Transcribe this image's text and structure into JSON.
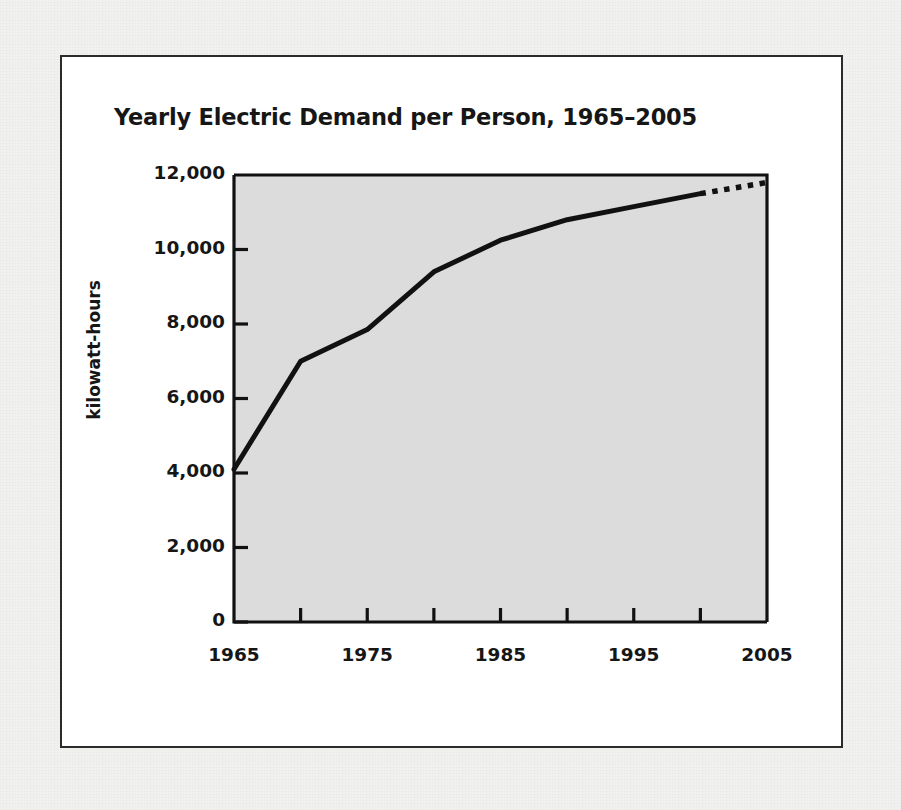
{
  "figure": {
    "title": "Yearly Electric Demand per Person, 1965–2005",
    "y_axis_label": "kilowatt-hours"
  },
  "colors": {
    "page_background": "#f1f1ef",
    "figure_background": "#ffffff",
    "figure_border": "#2b2b2b",
    "plot_background": "#dcdcdc",
    "axis": "#111111",
    "line": "#111111",
    "text": "#161616"
  },
  "chart_data": {
    "type": "line",
    "title": "Yearly Electric Demand per Person, 1965–2005",
    "subtitle": "",
    "xlabel": "",
    "ylabel": "kilowatt-hours",
    "xlim": [
      1965,
      2005
    ],
    "ylim": [
      0,
      12000
    ],
    "grid": false,
    "legend": null,
    "x_tick_labels": [
      "1965",
      "1975",
      "1985",
      "1995",
      "2005"
    ],
    "x_tick_values": [
      1965,
      1975,
      1985,
      1995,
      2005
    ],
    "x_minor_tick_values": [
      1970,
      1980,
      1990,
      2000
    ],
    "y_tick_labels": [
      "0",
      "2,000",
      "4,000",
      "6,000",
      "8,000",
      "10,000",
      "12,000"
    ],
    "y_tick_values": [
      0,
      2000,
      4000,
      6000,
      8000,
      10000,
      12000
    ],
    "series": [
      {
        "name": "Electric demand per person (actual)",
        "style": "solid",
        "x": [
          1965,
          1970,
          1975,
          1980,
          1985,
          1990,
          1995,
          2000
        ],
        "values": [
          4100,
          7000,
          7850,
          9400,
          10250,
          10800,
          11150,
          11500
        ]
      },
      {
        "name": "Electric demand per person (projected)",
        "style": "dotted",
        "x": [
          2000,
          2005
        ],
        "values": [
          11500,
          11800
        ]
      }
    ]
  }
}
